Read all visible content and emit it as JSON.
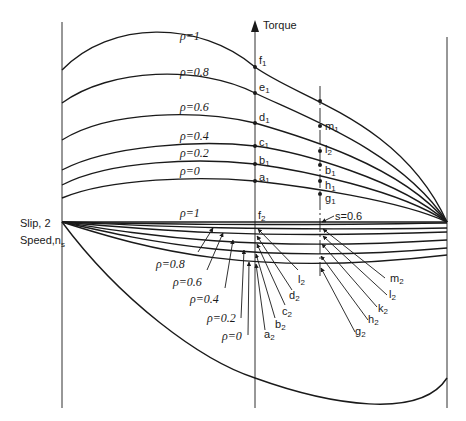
{
  "axis": {
    "torque_label": "Torque",
    "slip_label": "Slip, 2",
    "speed_label": "Speed,n",
    "speed_sub": "s"
  },
  "annotation": {
    "slip_marker": "s=0.6"
  },
  "upper_curves": [
    {
      "rho": "ρ=1",
      "point_center": "f",
      "sub_center": "1",
      "point_right": "",
      "sub_right": ""
    },
    {
      "rho": "ρ=0.8",
      "point_center": "e",
      "sub_center": "1",
      "point_right": "",
      "sub_right": ""
    },
    {
      "rho": "ρ=0.6",
      "point_center": "d",
      "sub_center": "1",
      "point_right": "m",
      "sub_right": "1"
    },
    {
      "rho": "ρ=0.4",
      "point_center": "c",
      "sub_center": "1",
      "point_right": "l",
      "sub_right": "2"
    },
    {
      "rho": "ρ=0.2",
      "point_center": "b",
      "sub_center": "1",
      "point_right": "b",
      "sub_right": "1"
    },
    {
      "rho": "ρ=0",
      "point_center": "a",
      "sub_center": "1",
      "point_right": "h",
      "sub_right": "1"
    }
  ],
  "extra_right_point": {
    "label": "g",
    "sub": "1"
  },
  "lower_curves": {
    "top_rho": "ρ=1",
    "top_point": "f",
    "top_sub": "2",
    "rho_labels": [
      "ρ=0.8",
      "ρ=0.6",
      "ρ=0.4",
      "ρ=0.2",
      "ρ=0"
    ],
    "center_points": [
      {
        "label": "l",
        "sub": "2"
      },
      {
        "label": "d",
        "sub": "2"
      },
      {
        "label": "c",
        "sub": "2"
      },
      {
        "label": "b",
        "sub": "2"
      },
      {
        "label": "a",
        "sub": "2"
      }
    ],
    "right_points": [
      {
        "label": "m",
        "sub": "2"
      },
      {
        "label": "l",
        "sub": "2"
      },
      {
        "label": "k",
        "sub": "2"
      },
      {
        "label": "h",
        "sub": "2"
      },
      {
        "label": "g",
        "sub": "2"
      }
    ]
  }
}
